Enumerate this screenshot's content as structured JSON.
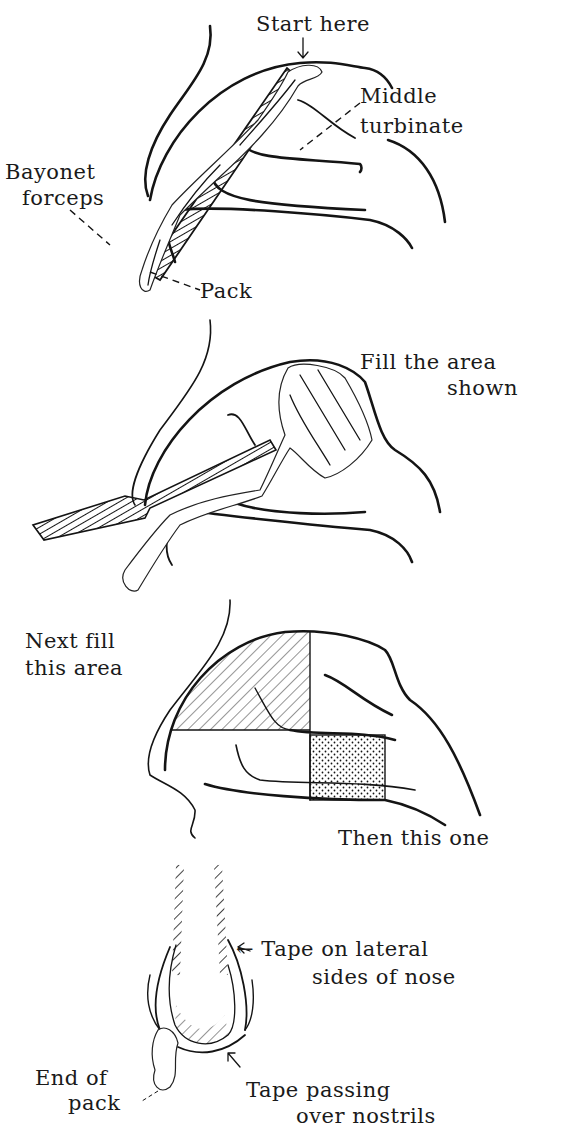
{
  "figure": {
    "top_fragment": "g                                         y",
    "panels": [
      {
        "id": "panel-1",
        "labels": {
          "start": "Start here",
          "turbinate_line1": "Middle",
          "turbinate_line2": "turbinate",
          "forceps_line1": "Bayonet",
          "forceps_line2": "forceps",
          "pack": "Pack"
        }
      },
      {
        "id": "panel-2",
        "labels": {
          "fill_line1": "Fill the area",
          "fill_line2": "shown"
        }
      },
      {
        "id": "panel-3",
        "labels": {
          "next_line1": "Next fill",
          "next_line2": "this area",
          "then": "Then this one"
        }
      },
      {
        "id": "panel-4",
        "labels": {
          "tape_lateral_line1": "← Tape on lateral",
          "tape_lateral_line2": "sides of nose",
          "end_line1": "End of",
          "end_line2": "pack",
          "tape_passing_line1": "Tape passing",
          "tape_passing_line2": "over nostrils"
        }
      }
    ]
  }
}
